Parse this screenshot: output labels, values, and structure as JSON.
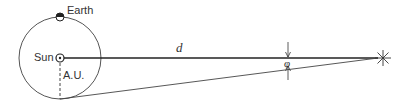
{
  "diagram": {
    "labels": {
      "earth": "Earth",
      "sun": "Sun",
      "au": "A.U.",
      "distance": "d",
      "angle": "φ"
    },
    "elements": {
      "orbit": {
        "cx": 60,
        "cy": 58,
        "r": 41
      },
      "sun": {
        "x": 60,
        "y": 58
      },
      "earth": {
        "x": 60,
        "y": 17
      },
      "star": {
        "x": 383,
        "y": 58
      }
    },
    "colors": {
      "stroke": "#333333",
      "background": "#ffffff"
    }
  }
}
